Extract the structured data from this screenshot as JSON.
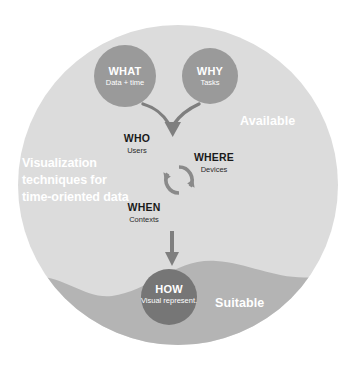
{
  "diagram": {
    "title": "Visualization techniques for time-oriented data",
    "colors": {
      "page_background": "#ffffff",
      "outer_circle": "#dcdcdc",
      "wave_band": "#b4b4b4",
      "node_circle": "#9a9a9a",
      "how_circle": "#767676",
      "arrow": "#7f7f7f",
      "cycle_arrow": "#8a8a8a",
      "white_text": "#ffffff",
      "dark_text": "#1a1a1a"
    },
    "regions": [
      {
        "id": "available",
        "label": "Available"
      },
      {
        "id": "suitable",
        "label": "Suitable"
      }
    ],
    "nodes": [
      {
        "id": "what",
        "title": "WHAT",
        "subtitle": "Data + time",
        "style": "circle"
      },
      {
        "id": "why",
        "title": "WHY",
        "subtitle": "Tasks",
        "style": "circle"
      },
      {
        "id": "who",
        "title": "WHO",
        "subtitle": "Users",
        "style": "plain"
      },
      {
        "id": "where",
        "title": "WHERE",
        "subtitle": "Devices",
        "style": "plain"
      },
      {
        "id": "when",
        "title": "WHEN",
        "subtitle": "Contexts",
        "style": "plain"
      },
      {
        "id": "how",
        "title": "HOW",
        "subtitle": "Visual represent.",
        "style": "circle"
      }
    ],
    "connectors": [
      {
        "id": "merge-arrow",
        "icon": "merge-down-arrow-icon",
        "from": [
          "what",
          "why"
        ],
        "to": "who-group"
      },
      {
        "id": "cycle-arrow",
        "icon": "circular-cycle-arrow-icon",
        "between": [
          "who",
          "where",
          "when"
        ]
      },
      {
        "id": "down-arrow",
        "icon": "down-arrow-icon",
        "from": "when",
        "to": "how"
      }
    ]
  }
}
